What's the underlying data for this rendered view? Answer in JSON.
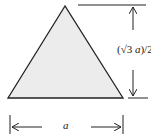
{
  "diagram": {
    "shape": "equilateral-triangle",
    "fill_color": "#ececec",
    "stroke_color": "#222222",
    "height_label": {
      "prefix": "(√3 ",
      "var": "a",
      "suffix": ")/2"
    },
    "base_label": "a"
  }
}
